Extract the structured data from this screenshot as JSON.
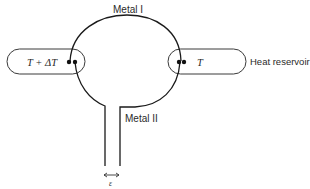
{
  "diagram": {
    "type": "thermocouple-circuit",
    "labels": {
      "metal_one": "Metal I",
      "metal_two": "Metal II",
      "hot_reservoir_temp": "T + ΔT",
      "cold_reservoir_temp": "T",
      "reservoir_caption": "Heat reservoir",
      "gap_symbol": "ε"
    },
    "colors": {
      "line": "#1a1a1a",
      "text": "#2a2a2a",
      "reservoir_outline": "#3a3a3a",
      "background": "#ffffff"
    },
    "nodes": [
      {
        "id": "hot-reservoir",
        "label": "T + ΔT"
      },
      {
        "id": "cold-reservoir",
        "label": "T"
      },
      {
        "id": "hot-junction"
      },
      {
        "id": "cold-junction"
      },
      {
        "id": "open-terminals",
        "gap_label": "ε"
      }
    ],
    "edges": [
      {
        "from": "hot-junction",
        "to": "cold-junction",
        "label": "Metal I"
      },
      {
        "from": "hot-junction",
        "to": "open-terminals",
        "label": "Metal II"
      },
      {
        "from": "cold-junction",
        "to": "open-terminals",
        "label": "Metal II"
      }
    ]
  }
}
